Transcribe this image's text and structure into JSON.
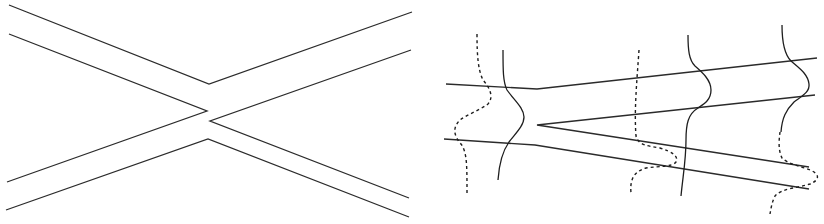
{
  "figure": {
    "panels": [
      {
        "id": "left",
        "description": "Two crossing channels (X-shaped junction) drawn as paired boundary lines",
        "color": "#2b2b2b"
      },
      {
        "id": "right",
        "description": "Channel splitting into two branches (Y-junction) with solid and dashed wave profiles overlaid",
        "color": "#1e1e1e",
        "profiles": {
          "solid_count": 3,
          "dashed_count": 3
        }
      }
    ]
  }
}
